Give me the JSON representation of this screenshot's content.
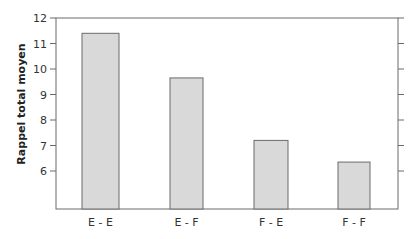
{
  "chart_data": {
    "type": "bar",
    "title": "",
    "xlabel": "",
    "ylabel": "Rappel total moyen",
    "categories": [
      "E - E",
      "E - F",
      "F - E",
      "F - F"
    ],
    "values": [
      11.4,
      9.65,
      7.2,
      6.35
    ],
    "ylim": [
      4.5,
      12
    ],
    "yticks": [
      6,
      7,
      8,
      9,
      10,
      11,
      12
    ],
    "grid": false,
    "legend": null,
    "colors": {
      "bar_fill": "#d9d9d9",
      "bar_stroke": "#6b6b6b",
      "axis": "#6b6b6b"
    }
  }
}
